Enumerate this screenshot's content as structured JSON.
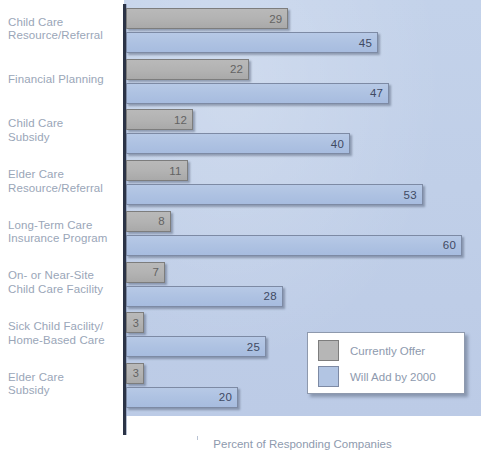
{
  "chart_data": {
    "type": "bar",
    "orientation": "horizontal",
    "title": "",
    "xlabel": "Percent of Responding Companies",
    "ylabel": "",
    "xlim": [
      0,
      60
    ],
    "grid": false,
    "legend_position": "inside-bottom-right",
    "categories": [
      "Child Care Resource/Referral",
      "Financial Planning",
      "Child Care Subsidy",
      "Elder Care Resource/Referral",
      "Long-Term Care Insurance Program",
      "On- or Near-Site Child Care Facility",
      "Sick Child Facility/Home-Based Care",
      "Elder Care Subsidy"
    ],
    "category_lines": [
      [
        "Child Care",
        "Resource/Referral"
      ],
      [
        "Financial Planning"
      ],
      [
        "Child Care",
        "Subsidy"
      ],
      [
        "Elder Care",
        "Resource/Referral"
      ],
      [
        "Long-Term Care",
        "Insurance Program"
      ],
      [
        "On- or Near-Site",
        "Child Care Facility"
      ],
      [
        "Sick Child Facility/",
        "Home-Based Care"
      ],
      [
        "Elder Care",
        "Subsidy"
      ]
    ],
    "series": [
      {
        "name": "Currently Offer",
        "color": "#b6b6b6",
        "values": [
          29,
          22,
          12,
          11,
          8,
          7,
          3,
          3
        ]
      },
      {
        "name": "Will Add by 2000",
        "color": "#b2c5e3",
        "values": [
          45,
          47,
          40,
          53,
          60,
          28,
          25,
          20
        ]
      }
    ]
  },
  "legend": {
    "items": [
      {
        "label": "Currently Offer",
        "swatch": "gray"
      },
      {
        "label": "Will Add by 2000",
        "swatch": "blue"
      }
    ]
  },
  "axis": {
    "x_title": "Percent of Responding Companies"
  },
  "colors": {
    "panel_background": "#c0cfe8",
    "gray_bar": "#b6b6b6",
    "blue_bar": "#b2c5e3",
    "label_text": "#9aa6b8",
    "axis_line": "#2b3346",
    "legend_background": "#ffffff"
  }
}
